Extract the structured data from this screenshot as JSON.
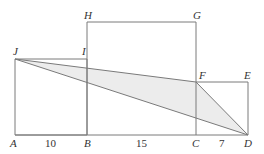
{
  "diagram": {
    "type": "geometry",
    "colors": {
      "stroke": "#7a7a7a",
      "shade": "#ececec",
      "text": "#333333"
    },
    "points": {
      "A": {
        "label": "A",
        "x": 15,
        "y": 135
      },
      "B": {
        "label": "B",
        "x": 87,
        "y": 135
      },
      "C": {
        "label": "C",
        "x": 196,
        "y": 135
      },
      "D": {
        "label": "D",
        "x": 248,
        "y": 135
      },
      "J": {
        "label": "J",
        "x": 15,
        "y": 59
      },
      "I": {
        "label": "I",
        "x": 87,
        "y": 59
      },
      "H": {
        "label": "H",
        "x": 87,
        "y": 22
      },
      "G": {
        "label": "G",
        "x": 196,
        "y": 22
      },
      "F": {
        "label": "F",
        "x": 196,
        "y": 82
      },
      "E": {
        "label": "E",
        "x": 248,
        "y": 82
      }
    },
    "squares": [
      {
        "name": "ABIJ",
        "side": "10"
      },
      {
        "name": "BCGH",
        "side": "15"
      },
      {
        "name": "CDEF",
        "side": "7"
      }
    ],
    "shaded_triangle": [
      "J",
      "F",
      "D"
    ],
    "segment_labels": {
      "AB": "10",
      "BC": "15",
      "CD": "7"
    }
  }
}
